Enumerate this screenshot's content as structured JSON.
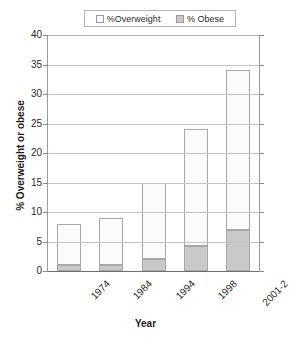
{
  "chart_data": {
    "type": "bar",
    "stacked": true,
    "title": "",
    "xlabel": "Year",
    "ylabel": "% Overweight or obese",
    "categories": [
      "1974",
      "1984",
      "1994",
      "1998",
      "2001-2"
    ],
    "series": [
      {
        "name": "%Overweight",
        "values": [
          7,
          8,
          13,
          19.7,
          27
        ]
      },
      {
        "name": "% Obese",
        "values": [
          1,
          1,
          2,
          4.3,
          7
        ]
      }
    ],
    "totals": [
      8,
      9,
      15,
      24,
      34
    ],
    "ylim": [
      0,
      40
    ],
    "yticks": [
      0,
      5,
      10,
      15,
      20,
      25,
      30,
      35,
      40
    ],
    "ytick_labels": [
      "0",
      "5",
      "10",
      "15",
      "20",
      "25",
      "30",
      "35",
      "40"
    ],
    "grid": true,
    "legend_position": "top",
    "colors": {
      "overweight": "#fbfbfb",
      "obese": "#c9c9c9",
      "border": "#a8a8a8",
      "grid": "#c4c4c4",
      "axis": "#6f6f6f"
    }
  },
  "legend": {
    "entries": [
      {
        "label": "%Overweight",
        "swatch": "overweight"
      },
      {
        "label": "% Obese",
        "swatch": "obese"
      }
    ]
  },
  "axes": {
    "x_title": "Year",
    "y_title": "% Overweight or obese"
  }
}
